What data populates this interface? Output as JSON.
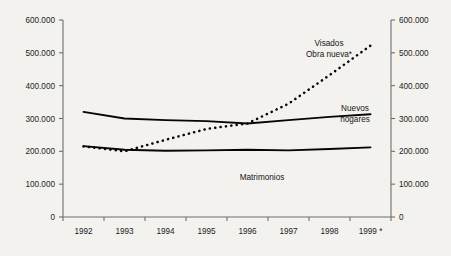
{
  "chart_data": {
    "type": "line",
    "title": "",
    "subtitle": "",
    "xlabel": "",
    "ylabel": "",
    "ylim": [
      0,
      600000
    ],
    "grid": false,
    "legend_position": "inline-annotations",
    "x": [
      "1992",
      "1993",
      "1994",
      "1995",
      "1996",
      "1997",
      "1998",
      "1999 *"
    ],
    "x_tick_labels": [
      "1992",
      "1993",
      "1994",
      "1995",
      "1996",
      "1997",
      "1998",
      "1999 *"
    ],
    "y_tick_labels_left": [
      "600.000",
      "500.000",
      "400.000",
      "300.000",
      "200.000",
      "100.000",
      "0"
    ],
    "y_tick_labels_right": [
      "600.000",
      "500.000",
      "400.000",
      "300.000",
      "200.000",
      "100.000",
      "0"
    ],
    "y_tick_values": [
      600000,
      500000,
      400000,
      300000,
      200000,
      100000,
      0
    ],
    "dual_axis": true,
    "series": [
      {
        "name": "Visados Obra nueva*",
        "style": "dotted",
        "color": "#050505",
        "values": [
          215000,
          200000,
          235000,
          268000,
          285000,
          345000,
          432000,
          522000
        ]
      },
      {
        "name": "Nuevos hogares",
        "style": "solid",
        "color": "#050505",
        "values": [
          320000,
          300000,
          295000,
          292000,
          285000,
          295000,
          305000,
          313000
        ]
      },
      {
        "name": "Matrimonios",
        "style": "solid",
        "color": "#050505",
        "values": [
          216000,
          205000,
          202000,
          203000,
          205000,
          203000,
          207000,
          212000
        ]
      }
    ],
    "annotations": [
      {
        "id": "visados",
        "line1": "Visados",
        "line2": "Obra nueva*"
      },
      {
        "id": "hogares",
        "line1": "Nuevos",
        "line2": "hogares"
      },
      {
        "id": "matrimonios",
        "line1": "Matrimonios",
        "line2": ""
      }
    ]
  }
}
